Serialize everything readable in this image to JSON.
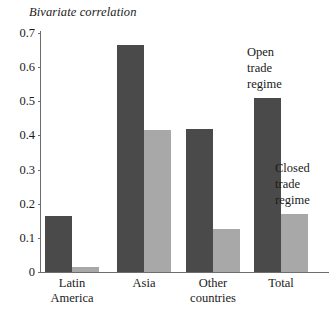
{
  "chart_data": {
    "type": "bar",
    "title": "Bivariate correlation",
    "xlabel": "",
    "ylabel": "Bivariate correlation",
    "ylim": [
      0,
      0.7
    ],
    "ytick_labels": [
      "0.7",
      "0.6",
      "0.5",
      "0.4",
      "0.3",
      "0.2",
      "0.1",
      "0"
    ],
    "ytick_values": [
      0.7,
      0.6,
      0.5,
      0.4,
      0.3,
      0.2,
      0.1,
      0
    ],
    "grid": false,
    "legend_position": "inline-annotations",
    "categories": [
      "Latin America",
      "Asia",
      "Other countries",
      "Total"
    ],
    "category_lines": [
      [
        "Latin",
        "America"
      ],
      [
        "Asia"
      ],
      [
        "Other",
        "countries"
      ],
      [
        "Total"
      ]
    ],
    "series": [
      {
        "name": "Open trade regime",
        "color": "#4a4a4a",
        "values": [
          0.165,
          0.665,
          0.42,
          0.51
        ]
      },
      {
        "name": "Closed trade regime",
        "color": "#a8a8a8",
        "values": [
          0.015,
          0.415,
          0.125,
          0.17
        ]
      }
    ],
    "annotations": [
      {
        "id": "open",
        "lines": [
          "Open",
          "trade",
          "regime"
        ],
        "series": "Open trade regime"
      },
      {
        "id": "closed",
        "lines": [
          "Closed",
          "trade",
          "regime"
        ],
        "series": "Closed trade regime"
      }
    ]
  }
}
